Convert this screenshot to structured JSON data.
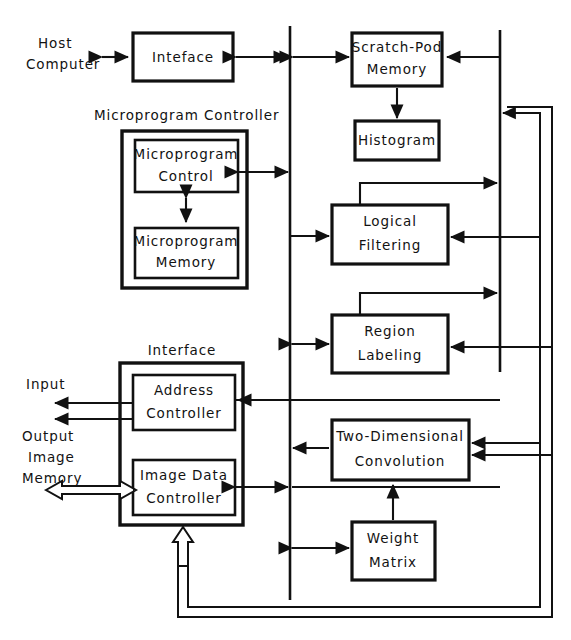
{
  "diagram": {
    "colors": {
      "ink": "#111111",
      "background": "#ffffff"
    },
    "labels": {
      "host_computer_line1": "Host",
      "host_computer_line2": "Computer",
      "microprogram_controller": "Microprogram Controller",
      "interface_group": "Interface",
      "input": "Input",
      "output": "Output",
      "image_line": "Image",
      "memory_line": "Memory"
    },
    "blocks": {
      "interface_top": {
        "line1": "Inteface"
      },
      "scratch_pad": {
        "line1": "Scratch-Pod",
        "line2": "Memory"
      },
      "histogram": {
        "line1": "Histogram"
      },
      "microprogram_control": {
        "line1": "Microprogram",
        "line2": "Control"
      },
      "microprogram_memory": {
        "line1": "Microprogram",
        "line2": "Memory"
      },
      "logical_filtering": {
        "line1": "Logical",
        "line2": "Filtering"
      },
      "region_labeling": {
        "line1": "Region",
        "line2": "Labeling"
      },
      "address_controller": {
        "line1": "Address",
        "line2": "Controller"
      },
      "image_data_controller": {
        "line1": "Image Data",
        "line2": "Controller"
      },
      "two_dimensional_convolution": {
        "line1": "Two-Dimensional",
        "line2": "Convolution"
      },
      "weight_matrix": {
        "line1": "Weight",
        "line2": "Matrix"
      }
    }
  }
}
